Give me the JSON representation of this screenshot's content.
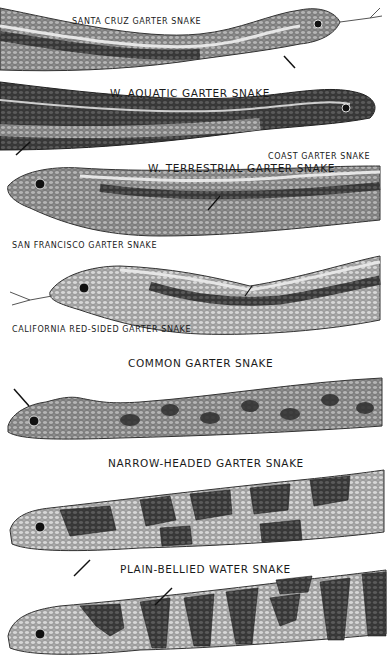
{
  "plate": {
    "background": "#ffffff",
    "ink_color": "#1a1a1a",
    "labels": [
      {
        "id": "santa-cruz",
        "text": "SANTA CRUZ GARTER SNAKE"
      },
      {
        "id": "w-aquatic",
        "text": "W. AQUATIC GARTER SNAKE"
      },
      {
        "id": "coast",
        "text": "COAST GARTER SNAKE"
      },
      {
        "id": "w-terrestrial",
        "text": "W. TERRESTRIAL GARTER SNAKE"
      },
      {
        "id": "san-francisco",
        "text": "SAN FRANCISCO GARTER SNAKE"
      },
      {
        "id": "california-red-sided",
        "text": "CALIFORNIA RED-SIDED GARTER SNAKE"
      },
      {
        "id": "common",
        "text": "COMMON GARTER SNAKE"
      },
      {
        "id": "narrow-headed",
        "text": "NARROW-HEADED GARTER SNAKE"
      },
      {
        "id": "plain-bellied",
        "text": "PLAIN-BELLIED WATER SNAKE"
      }
    ],
    "snakes": [
      {
        "id": "snake-1",
        "head": "right",
        "pattern": "striped"
      },
      {
        "id": "snake-2",
        "head": "right",
        "pattern": "checkered"
      },
      {
        "id": "snake-3",
        "head": "left",
        "pattern": "striped"
      },
      {
        "id": "snake-4",
        "head": "left",
        "pattern": "striped-tongue"
      },
      {
        "id": "snake-5",
        "head": "left",
        "pattern": "spotted"
      },
      {
        "id": "snake-6",
        "head": "left",
        "pattern": "blotched"
      },
      {
        "id": "snake-7",
        "head": "left",
        "pattern": "banded"
      }
    ]
  }
}
